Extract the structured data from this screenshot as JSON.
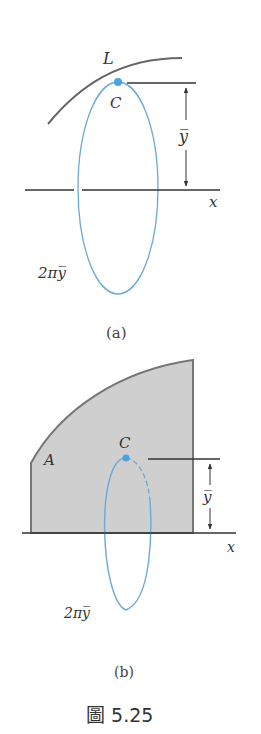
{
  "figure": {
    "caption": "圖 5.25",
    "colors": {
      "line": "#555555",
      "ring": "#6aa9d8",
      "centroid": "#4aa3df",
      "area_fill": "#cfcfcf",
      "area_stroke": "#777777"
    },
    "part_a": {
      "label": "(a)",
      "curve_label": "L",
      "centroid_label": "C",
      "distance_label": "y̅",
      "axis_label": "x",
      "ring_label": "2πy̅"
    },
    "part_b": {
      "label": "(b)",
      "area_label": "A",
      "centroid_label": "C",
      "distance_label": "y̅",
      "axis_label": "x",
      "ring_label": "2πy̅"
    }
  }
}
